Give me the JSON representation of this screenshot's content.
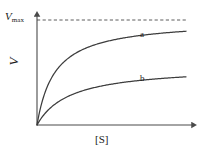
{
  "figure": {
    "background_color": "#ffffff",
    "line_color": "#3d3d3d",
    "axis_color": "#4a4a4a"
  },
  "labels": {
    "vmax_symbol": "V",
    "vmax_subscript": "max",
    "y_axis": "V",
    "x_axis": "[S]",
    "curve_a": "a",
    "curve_b": "b"
  },
  "chart_data": {
    "type": "line",
    "title": "",
    "subtitle": "",
    "xlabel": "[S]",
    "ylabel": "V",
    "grid": false,
    "legend": "inline-curve-labels",
    "xlim": [
      0,
      1
    ],
    "ylim": [
      0,
      1.08
    ],
    "x_tick_labels": [],
    "y_tick_labels": [
      "V_max"
    ],
    "annotations": [
      {
        "text": "V",
        "subscript": "max",
        "type": "axis-value-label",
        "y": 1.0
      },
      {
        "text": "a",
        "type": "curve-label",
        "x": 0.66,
        "y": 0.86
      },
      {
        "text": "b",
        "type": "curve-label",
        "x": 0.66,
        "y": 0.45
      }
    ],
    "reference_lines": [
      {
        "name": "Vmax",
        "orientation": "horizontal",
        "y": 1.0,
        "style": "dashed"
      }
    ],
    "series": [
      {
        "name": "a",
        "model": "michaelis-menten",
        "vmax": 1.0,
        "km": 0.12,
        "x": [
          0,
          0.04,
          0.08,
          0.12,
          0.16,
          0.2,
          0.26,
          0.32,
          0.4,
          0.5,
          0.6,
          0.7,
          0.8,
          0.9,
          1.0
        ],
        "values": [
          0,
          0.25,
          0.4,
          0.5,
          0.57,
          0.63,
          0.68,
          0.73,
          0.77,
          0.81,
          0.83,
          0.85,
          0.87,
          0.88,
          0.89
        ]
      },
      {
        "name": "b",
        "model": "michaelis-menten",
        "vmax": 0.56,
        "km": 0.22,
        "x": [
          0,
          0.04,
          0.08,
          0.12,
          0.16,
          0.2,
          0.26,
          0.32,
          0.4,
          0.5,
          0.6,
          0.7,
          0.8,
          0.9,
          1.0
        ],
        "values": [
          0,
          0.086,
          0.149,
          0.197,
          0.236,
          0.267,
          0.303,
          0.332,
          0.361,
          0.389,
          0.41,
          0.426,
          0.439,
          0.449,
          0.459
        ]
      }
    ]
  }
}
